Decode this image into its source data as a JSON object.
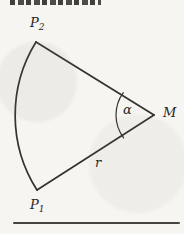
{
  "figure": {
    "type": "geometry-diagram",
    "top_edge_note": "bottom sliver of a clipped bold heading, letters cut off and unreadable",
    "labels": {
      "p_letter": "P",
      "p2_subscript": "2",
      "p1_subscript": "1",
      "center": "M",
      "angle": "α",
      "radius": "r"
    },
    "colors": {
      "ink": "#333230",
      "background": "#f6f5f1"
    }
  }
}
